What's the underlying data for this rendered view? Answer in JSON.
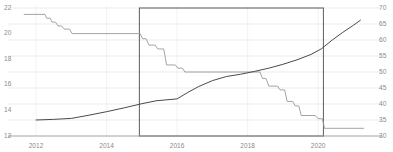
{
  "chart_data": {
    "type": "line",
    "title": "",
    "subtitle": "",
    "xlabel": "",
    "ylabel": "",
    "grid": true,
    "legend_position": "none",
    "xlim": [
      2011.6,
      2021.3
    ],
    "x_ticks": [
      "2012",
      "2014",
      "2016",
      "2018",
      "2020"
    ],
    "x_tick_values": [
      2012,
      2014,
      2016,
      2018,
      2020
    ],
    "left_axis": {
      "label": "",
      "ylim": [
        12,
        22
      ],
      "ticks": [
        "12",
        "14",
        "16",
        "18",
        "20",
        "22"
      ],
      "tick_values": [
        12,
        14,
        16,
        18,
        20,
        22
      ]
    },
    "right_axis": {
      "label": "",
      "ylim": [
        30,
        70
      ],
      "ticks": [
        "30",
        "35",
        "40",
        "45",
        "50",
        "55",
        "60",
        "65",
        "70"
      ],
      "tick_values": [
        30,
        35,
        40,
        45,
        50,
        55,
        60,
        65,
        70
      ]
    },
    "series": [
      {
        "name": "step-series-left-axis",
        "axis": "left",
        "color": "#9a9a9a",
        "width": 0.9,
        "style": "step",
        "points": [
          [
            2011.65,
            21.5
          ],
          [
            2012.25,
            21.5
          ],
          [
            2012.3,
            21.2
          ],
          [
            2012.4,
            21.2
          ],
          [
            2012.45,
            20.9
          ],
          [
            2012.55,
            20.9
          ],
          [
            2012.62,
            20.6
          ],
          [
            2012.72,
            20.6
          ],
          [
            2012.8,
            20.35
          ],
          [
            2012.95,
            20.35
          ],
          [
            2013.02,
            20.0
          ],
          [
            2014.95,
            20.0
          ],
          [
            2015.02,
            19.6
          ],
          [
            2015.12,
            19.6
          ],
          [
            2015.2,
            19.1
          ],
          [
            2015.38,
            19.1
          ],
          [
            2015.45,
            18.8
          ],
          [
            2015.62,
            18.8
          ],
          [
            2015.7,
            17.55
          ],
          [
            2015.95,
            17.55
          ],
          [
            2016.02,
            17.3
          ],
          [
            2016.15,
            17.3
          ],
          [
            2016.22,
            17.0
          ],
          [
            2018.35,
            17.0
          ],
          [
            2018.42,
            16.5
          ],
          [
            2018.52,
            16.5
          ],
          [
            2018.6,
            15.9
          ],
          [
            2018.85,
            15.9
          ],
          [
            2018.92,
            15.6
          ],
          [
            2019.05,
            15.6
          ],
          [
            2019.12,
            14.7
          ],
          [
            2019.28,
            14.7
          ],
          [
            2019.35,
            14.35
          ],
          [
            2019.45,
            14.35
          ],
          [
            2019.52,
            13.6
          ],
          [
            2019.92,
            13.6
          ],
          [
            2020.0,
            13.35
          ],
          [
            2020.12,
            13.35
          ],
          [
            2020.18,
            12.6
          ],
          [
            2021.3,
            12.6
          ]
        ]
      },
      {
        "name": "rising-series-right-axis",
        "axis": "right",
        "color": "#4a4a4a",
        "width": 1.0,
        "style": "line",
        "points": [
          [
            2012.0,
            35.0
          ],
          [
            2012.5,
            35.2
          ],
          [
            2013.0,
            35.5
          ],
          [
            2013.5,
            36.5
          ],
          [
            2014.0,
            37.6
          ],
          [
            2014.5,
            38.8
          ],
          [
            2015.0,
            40.1
          ],
          [
            2015.4,
            41.0
          ],
          [
            2015.8,
            41.4
          ],
          [
            2016.0,
            41.6
          ],
          [
            2016.3,
            43.6
          ],
          [
            2016.6,
            45.4
          ],
          [
            2017.0,
            47.3
          ],
          [
            2017.4,
            48.6
          ],
          [
            2017.8,
            49.3
          ],
          [
            2018.2,
            50.2
          ],
          [
            2018.6,
            51.2
          ],
          [
            2019.0,
            52.4
          ],
          [
            2019.4,
            53.8
          ],
          [
            2019.8,
            55.5
          ],
          [
            2020.1,
            57.3
          ],
          [
            2020.4,
            60.0
          ],
          [
            2020.7,
            62.4
          ],
          [
            2021.0,
            64.6
          ],
          [
            2021.2,
            66.2
          ]
        ]
      }
    ],
    "highlight_region": {
      "name": "highlight-rectangle",
      "x_start": 2014.93,
      "x_end": 2020.15,
      "y_start": 12,
      "y_end": 22,
      "stroke": "#6b6b6b",
      "fill": "none"
    }
  }
}
